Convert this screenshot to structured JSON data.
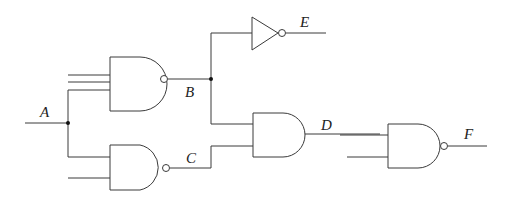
{
  "diagram": {
    "type": "logic-circuit",
    "signals": {
      "A": "A",
      "B": "B",
      "C": "C",
      "D": "D",
      "E": "E",
      "F": "F"
    },
    "gates": [
      {
        "id": "g1",
        "type": "NAND",
        "inputs": 3,
        "output": "B"
      },
      {
        "id": "g2",
        "type": "NAND",
        "inputs": 2,
        "output": "C"
      },
      {
        "id": "g3",
        "type": "NOT",
        "inputs": 1,
        "output": "E"
      },
      {
        "id": "g4",
        "type": "AND",
        "inputs": 2,
        "output": "D"
      },
      {
        "id": "g5",
        "type": "NAND",
        "inputs": 2,
        "output": "F"
      }
    ],
    "colors": {
      "line": "#3a3a3a",
      "background": "#ffffff"
    }
  }
}
